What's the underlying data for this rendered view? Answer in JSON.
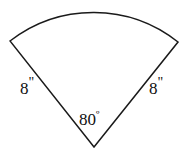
{
  "figure": {
    "shape_type": "circular sector (pie slice)",
    "stroke_color": "#1a1a1a",
    "fill_color": "#ffffff",
    "background_color": "#ffffff"
  },
  "labels": {
    "left_radius": "8",
    "left_radius_unit": "\"",
    "right_radius": "8",
    "right_radius_unit": "\"",
    "apex_angle": "80",
    "apex_angle_unit": "º"
  },
  "geometry": {
    "apex_x": 94,
    "apex_y": 147,
    "radius_px": 136,
    "sweep_degrees": 80,
    "left_endpoint_x": 10,
    "left_endpoint_y": 41,
    "right_endpoint_x": 178,
    "right_endpoint_y": 42,
    "arc_top_x": 95,
    "arc_top_y": 7,
    "path": "M 94 147 L 10 41 A 136 136 0 0 1 178 42 Z"
  }
}
